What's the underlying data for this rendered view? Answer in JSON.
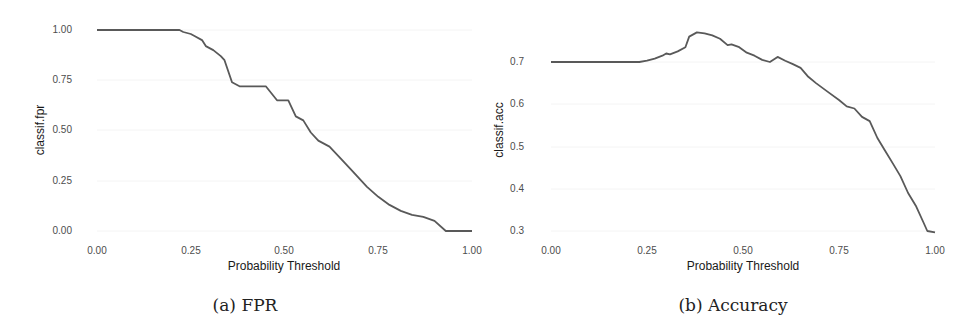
{
  "chart_data": [
    {
      "type": "line",
      "title": "",
      "caption": "(a) FPR",
      "xlabel": "Probability Threshold",
      "ylabel": "classif.fpr",
      "xlim": [
        0,
        1
      ],
      "ylim": [
        0,
        1
      ],
      "xticks": [
        "0.00",
        "0.25",
        "0.50",
        "0.75",
        "1.00"
      ],
      "yticks": [
        "0.00",
        "0.25",
        "0.50",
        "0.75",
        "1.00"
      ],
      "grid": false,
      "line_color": "#595959",
      "x": [
        0.0,
        0.22,
        0.23,
        0.25,
        0.26,
        0.28,
        0.29,
        0.31,
        0.33,
        0.34,
        0.36,
        0.38,
        0.45,
        0.48,
        0.51,
        0.53,
        0.55,
        0.57,
        0.59,
        0.62,
        0.65,
        0.68,
        0.72,
        0.75,
        0.78,
        0.81,
        0.84,
        0.87,
        0.9,
        0.93,
        1.0
      ],
      "y": [
        1.0,
        1.0,
        0.99,
        0.98,
        0.97,
        0.95,
        0.92,
        0.9,
        0.87,
        0.85,
        0.74,
        0.72,
        0.72,
        0.65,
        0.65,
        0.57,
        0.55,
        0.49,
        0.45,
        0.42,
        0.36,
        0.3,
        0.22,
        0.17,
        0.13,
        0.1,
        0.08,
        0.07,
        0.05,
        0.0,
        0.0
      ]
    },
    {
      "type": "line",
      "title": "",
      "caption": "(b) Accuracy",
      "xlabel": "Probability Threshold",
      "ylabel": "classif.acc",
      "xlim": [
        0,
        1
      ],
      "ylim": [
        0.3,
        0.7
      ],
      "xticks": [
        "0.00",
        "0.25",
        "0.50",
        "0.75",
        "1.00"
      ],
      "yticks": [
        "0.3",
        "0.4",
        "0.5",
        "0.6",
        "0.7"
      ],
      "grid": false,
      "line_color": "#595959",
      "x": [
        0.0,
        0.23,
        0.25,
        0.27,
        0.29,
        0.3,
        0.31,
        0.33,
        0.35,
        0.36,
        0.38,
        0.4,
        0.42,
        0.44,
        0.46,
        0.47,
        0.49,
        0.51,
        0.53,
        0.55,
        0.57,
        0.59,
        0.61,
        0.63,
        0.65,
        0.67,
        0.69,
        0.72,
        0.75,
        0.77,
        0.79,
        0.81,
        0.83,
        0.85,
        0.87,
        0.89,
        0.91,
        0.93,
        0.95,
        0.97,
        0.98,
        1.0
      ],
      "y": [
        0.7,
        0.7,
        0.703,
        0.708,
        0.715,
        0.72,
        0.718,
        0.725,
        0.735,
        0.76,
        0.77,
        0.768,
        0.763,
        0.755,
        0.74,
        0.742,
        0.735,
        0.722,
        0.715,
        0.705,
        0.7,
        0.712,
        0.703,
        0.695,
        0.686,
        0.665,
        0.65,
        0.63,
        0.61,
        0.595,
        0.59,
        0.57,
        0.56,
        0.52,
        0.49,
        0.46,
        0.43,
        0.39,
        0.36,
        0.32,
        0.3,
        0.297
      ]
    }
  ]
}
